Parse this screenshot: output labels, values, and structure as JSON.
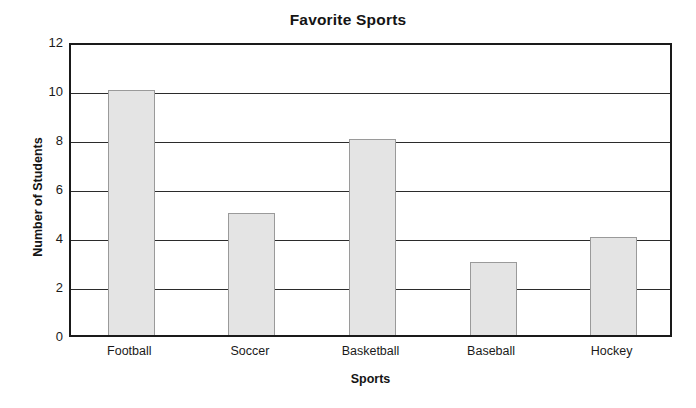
{
  "chart_data": {
    "type": "bar",
    "title": "Favorite Sports",
    "xlabel": "Sports",
    "ylabel": "Number of Students",
    "categories": [
      "Football",
      "Soccer",
      "Basketball",
      "Baseball",
      "Hockey"
    ],
    "values": [
      10,
      5,
      8,
      3,
      4
    ],
    "ylim": [
      0,
      12
    ],
    "ytick_step": 2,
    "ytick_labels": [
      "0",
      "2",
      "4",
      "6",
      "8",
      "10",
      "12"
    ],
    "grid": "horizontal",
    "legend": "none",
    "bar_fill_color": "#e4e4e4",
    "bar_border_color": "#9a9a9a",
    "axis_color": "#1a1a1a",
    "background_color": "#ffffff"
  }
}
